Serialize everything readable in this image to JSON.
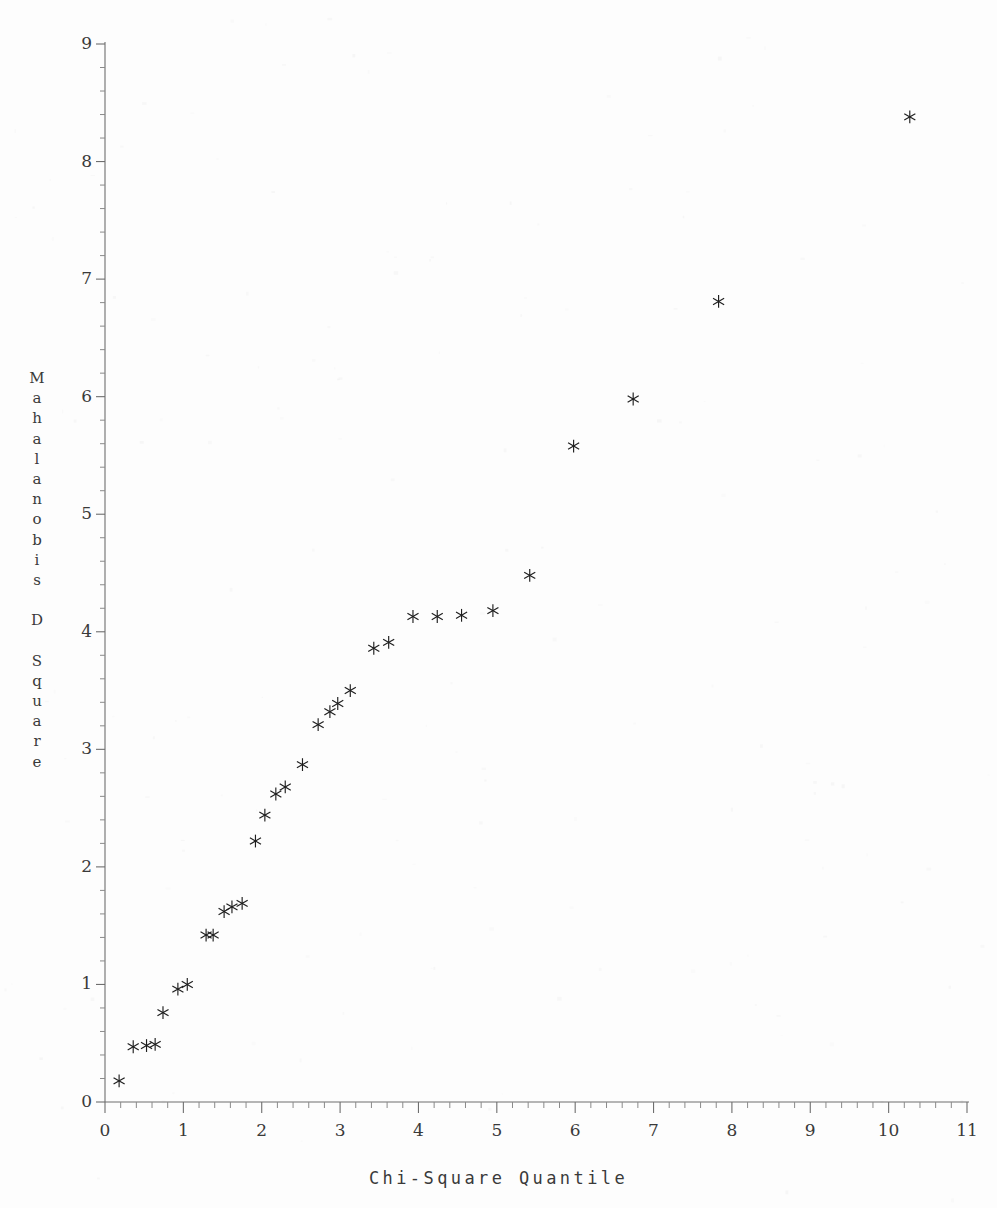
{
  "title": "",
  "chart_data": {
    "type": "scatter",
    "title": "",
    "xlabel": "Chi-Square Quantile",
    "ylabel": "Mahalanobis D Square",
    "xlim": [
      0,
      11
    ],
    "ylim": [
      0,
      9
    ],
    "xticks": [
      0,
      1,
      2,
      3,
      4,
      5,
      6,
      7,
      8,
      9,
      10,
      11
    ],
    "yticks": [
      0,
      1,
      2,
      3,
      4,
      5,
      6,
      7,
      8,
      9
    ],
    "x_minor_step": 0.2,
    "y_minor_step": 0.2,
    "grid": false,
    "legend": null,
    "marker": "asterisk",
    "marker_color": "#1e1e1e",
    "points": [
      {
        "x": 0.18,
        "y": 0.18
      },
      {
        "x": 0.36,
        "y": 0.47
      },
      {
        "x": 0.53,
        "y": 0.48
      },
      {
        "x": 0.64,
        "y": 0.49
      },
      {
        "x": 0.74,
        "y": 0.76
      },
      {
        "x": 0.93,
        "y": 0.96
      },
      {
        "x": 1.05,
        "y": 1.0
      },
      {
        "x": 1.29,
        "y": 1.42
      },
      {
        "x": 1.38,
        "y": 1.42
      },
      {
        "x": 1.52,
        "y": 1.62
      },
      {
        "x": 1.62,
        "y": 1.66
      },
      {
        "x": 1.75,
        "y": 1.69
      },
      {
        "x": 1.92,
        "y": 2.22
      },
      {
        "x": 2.04,
        "y": 2.44
      },
      {
        "x": 2.18,
        "y": 2.62
      },
      {
        "x": 2.3,
        "y": 2.68
      },
      {
        "x": 2.52,
        "y": 2.87
      },
      {
        "x": 2.72,
        "y": 3.21
      },
      {
        "x": 2.87,
        "y": 3.32
      },
      {
        "x": 2.97,
        "y": 3.39
      },
      {
        "x": 3.13,
        "y": 3.5
      },
      {
        "x": 3.43,
        "y": 3.86
      },
      {
        "x": 3.62,
        "y": 3.91
      },
      {
        "x": 3.93,
        "y": 4.13
      },
      {
        "x": 4.24,
        "y": 4.13
      },
      {
        "x": 4.55,
        "y": 4.14
      },
      {
        "x": 4.95,
        "y": 4.18
      },
      {
        "x": 5.42,
        "y": 4.48
      },
      {
        "x": 5.98,
        "y": 5.58
      },
      {
        "x": 6.74,
        "y": 5.98
      },
      {
        "x": 7.83,
        "y": 6.81
      },
      {
        "x": 10.27,
        "y": 8.38
      }
    ]
  },
  "axis": {
    "x_tick_labels": [
      "0",
      "1",
      "2",
      "3",
      "4",
      "5",
      "6",
      "7",
      "8",
      "9",
      "10",
      "11"
    ],
    "y_tick_labels": [
      "0",
      "1",
      "2",
      "3",
      "4",
      "5",
      "6",
      "7",
      "8",
      "9"
    ],
    "x_title": "Chi-Square Quantile",
    "y_title": "Mahalanobis D Square"
  }
}
